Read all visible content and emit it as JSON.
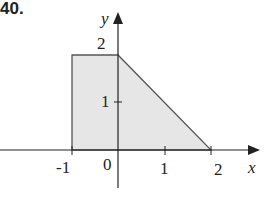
{
  "problem": {
    "number": "40."
  },
  "axes": {
    "x_label": "x",
    "y_label": "y",
    "x_ticks": [
      "-1",
      "0",
      "1",
      "2"
    ],
    "y_ticks": [
      "1",
      "2"
    ]
  },
  "region": {
    "vertices": [
      [
        -1,
        0
      ],
      [
        -1,
        2
      ],
      [
        0,
        2
      ],
      [
        2,
        0
      ]
    ],
    "fill": "#e6e6e6",
    "stroke": "#555555"
  }
}
